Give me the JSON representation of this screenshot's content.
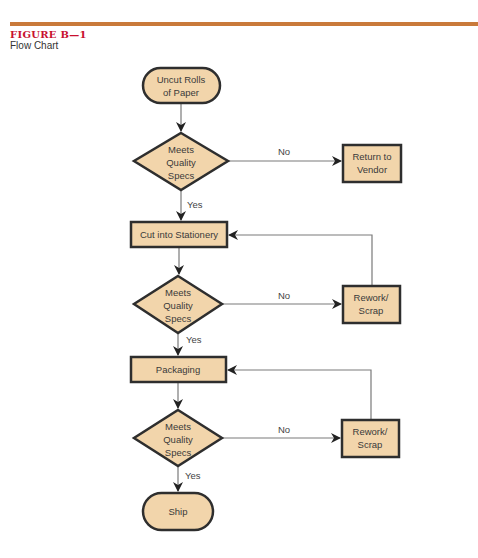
{
  "figure": {
    "label": "FIGURE B—1",
    "title": "Flow Chart"
  },
  "colors": {
    "rule": "#c97a3a",
    "label": "#c8102e",
    "node_fill": "#f2d5ab",
    "node_stroke": "#2e2e2e",
    "edge": "#7a7a7a",
    "arrowhead": "#222222"
  },
  "nodes": {
    "start": {
      "type": "terminal",
      "lines": [
        "Uncut Rolls",
        "of Paper"
      ]
    },
    "check1": {
      "type": "decision",
      "lines": [
        "Meets",
        "Quality",
        "Specs"
      ]
    },
    "return_vendor": {
      "type": "process",
      "lines": [
        "Return to",
        "Vendor"
      ]
    },
    "cut": {
      "type": "process",
      "lines": [
        "Cut into Stationery"
      ]
    },
    "check2": {
      "type": "decision",
      "lines": [
        "Meets",
        "Quality",
        "Specs"
      ]
    },
    "rework1": {
      "type": "process",
      "lines": [
        "Rework/",
        "Scrap"
      ]
    },
    "packaging": {
      "type": "process",
      "lines": [
        "Packaging"
      ]
    },
    "check3": {
      "type": "decision",
      "lines": [
        "Meets",
        "Quality",
        "Specs"
      ]
    },
    "rework2": {
      "type": "process",
      "lines": [
        "Rework/",
        "Scrap"
      ]
    },
    "ship": {
      "type": "terminal",
      "lines": [
        "Ship"
      ]
    }
  },
  "edges": {
    "check1_no": "No",
    "check1_yes": "Yes",
    "check2_no": "No",
    "check2_yes": "Yes",
    "check3_no": "No",
    "check3_yes": "Yes"
  }
}
